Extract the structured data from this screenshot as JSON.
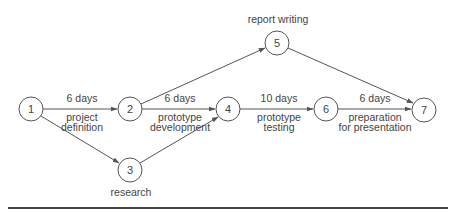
{
  "diagram": {
    "type": "activity-network",
    "colors": {
      "line": "#555555",
      "text": "#444444",
      "rule": "#444444",
      "background": "#ffffff"
    },
    "nodes": [
      {
        "id": "1",
        "label": "1",
        "x": 31,
        "y": 109
      },
      {
        "id": "2",
        "label": "2",
        "x": 130,
        "y": 109
      },
      {
        "id": "3",
        "label": "3",
        "x": 130,
        "y": 170,
        "caption": "research"
      },
      {
        "id": "4",
        "label": "4",
        "x": 228,
        "y": 109
      },
      {
        "id": "5",
        "label": "5",
        "x": 277,
        "y": 43,
        "caption": "report writing"
      },
      {
        "id": "6",
        "label": "6",
        "x": 326,
        "y": 109
      },
      {
        "id": "7",
        "label": "7",
        "x": 424,
        "y": 110
      }
    ],
    "edges": [
      {
        "from": "1",
        "to": "2",
        "duration": "6 days",
        "activity_line1": "project",
        "activity_line2": "definition"
      },
      {
        "from": "1",
        "to": "3"
      },
      {
        "from": "2",
        "to": "4",
        "duration": "6 days",
        "activity_line1": "prototype",
        "activity_line2": "development"
      },
      {
        "from": "2",
        "to": "5"
      },
      {
        "from": "3",
        "to": "4"
      },
      {
        "from": "4",
        "to": "6",
        "duration": "10 days",
        "activity_line1": "prototype",
        "activity_line2": "testing"
      },
      {
        "from": "6",
        "to": "7",
        "duration": "6 days",
        "activity_line1": "preparation",
        "activity_line2": "for presentation"
      },
      {
        "from": "5",
        "to": "7"
      }
    ],
    "captions": {
      "node3": "research",
      "node5": "report writing"
    }
  }
}
